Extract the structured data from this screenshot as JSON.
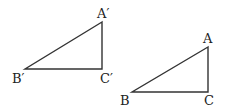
{
  "diagram": {
    "triangles": [
      {
        "name": "triangle-prime",
        "vertices": {
          "A": {
            "label": "A′",
            "x": 102,
            "y": 22
          },
          "B": {
            "label": "B′",
            "x": 25,
            "y": 69
          },
          "C": {
            "label": "C′",
            "x": 102,
            "y": 69
          }
        }
      },
      {
        "name": "triangle-original",
        "vertices": {
          "A": {
            "label": "A",
            "x": 208,
            "y": 47
          },
          "B": {
            "label": "B",
            "x": 132,
            "y": 92
          },
          "C": {
            "label": "C",
            "x": 208,
            "y": 92
          }
        }
      }
    ],
    "stroke_color": "#333333"
  }
}
